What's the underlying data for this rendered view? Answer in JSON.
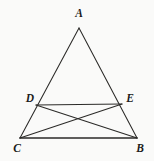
{
  "figure": {
    "background_color": "#fafaf9",
    "line_color": "#2b2a28",
    "label_color": "#1d1c1b",
    "canvas": {
      "width": 154,
      "height": 161
    },
    "points": {
      "A": {
        "x": 79,
        "y": 28,
        "label": "A",
        "label_x": 79,
        "label_y": 14
      },
      "B": {
        "x": 137,
        "y": 138,
        "label": "B",
        "label_x": 140,
        "label_y": 149
      },
      "C": {
        "x": 20,
        "y": 138,
        "label": "C",
        "label_x": 17,
        "label_y": 149
      },
      "D": {
        "x": 36,
        "y": 105,
        "label": "D",
        "label_x": 30,
        "label_y": 99
      },
      "E": {
        "x": 122,
        "y": 104,
        "label": "E",
        "label_x": 130,
        "label_y": 99
      }
    },
    "segments": [
      {
        "name": "side-AC",
        "from": "A",
        "to": "C",
        "weight": "thin"
      },
      {
        "name": "side-AB",
        "from": "A",
        "to": "B",
        "weight": "thin"
      },
      {
        "name": "base-CB",
        "from": "C",
        "to": "B",
        "weight": "thick"
      },
      {
        "name": "segment-DE",
        "from": "D",
        "to": "E",
        "weight": "thin"
      },
      {
        "name": "cevian-DB",
        "from": "D",
        "to": "B",
        "weight": "thin"
      },
      {
        "name": "cevian-CE",
        "from": "C",
        "to": "E",
        "weight": "thin"
      }
    ],
    "intersection": {
      "name": "cevian-crossing",
      "x": 79,
      "y": 120
    },
    "labels": [
      "A",
      "D",
      "E",
      "C",
      "B"
    ]
  }
}
